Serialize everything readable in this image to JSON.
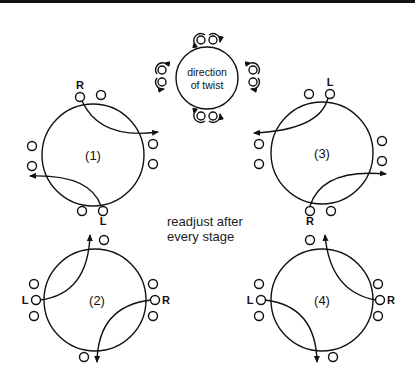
{
  "diagram": {
    "type": "twist-sequence",
    "center": {
      "label_line1": "direction",
      "label_line2": "of twist"
    },
    "stages": [
      {
        "id": "1",
        "label": "(1)",
        "top_label": "R",
        "bottom_label": "L"
      },
      {
        "id": "2",
        "label": "(2)",
        "left_label": "L",
        "right_label": "R"
      },
      {
        "id": "3",
        "label": "(3)",
        "top_label": "L",
        "bottom_label": "R"
      },
      {
        "id": "4",
        "label": "(4)",
        "left_label": "L",
        "right_label": "R"
      }
    ],
    "note_line1": "readjust after",
    "note_line2": "every stage"
  },
  "colors": {
    "stroke": "#111111",
    "background": "#ffffff"
  }
}
